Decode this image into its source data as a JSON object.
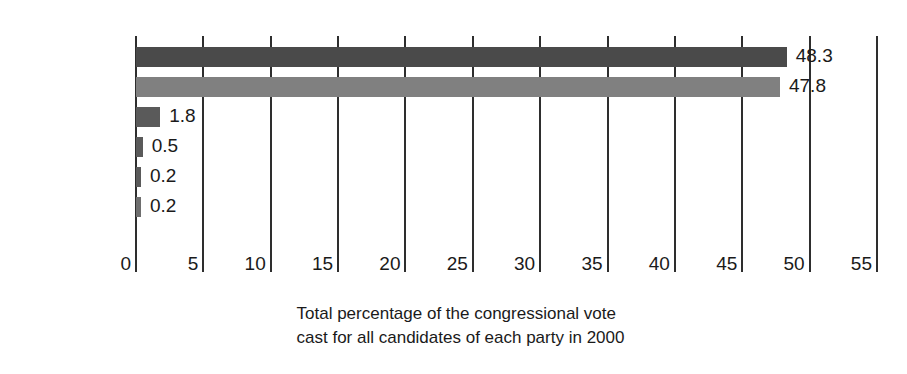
{
  "chart_data": {
    "type": "bar",
    "orientation": "horizontal",
    "title": "",
    "caption_line1": "Total percentage of the congressional vote",
    "caption_line2": "cast for all candidates of each party in 2000",
    "xlabel": "",
    "ylabel": "",
    "xlim": [
      0,
      55
    ],
    "xticks": [
      0,
      5,
      10,
      15,
      20,
      25,
      30,
      35,
      40,
      45,
      50,
      55
    ],
    "xtick_labels": [
      "0",
      "5",
      "10",
      "15",
      "20",
      "25",
      "30",
      "35",
      "40",
      "45",
      "50",
      "55"
    ],
    "grid": true,
    "legend": "none",
    "categories": [
      "Republicans",
      "Democrats",
      "Libertarians",
      "Natural Law",
      "Reform",
      "Green"
    ],
    "values": [
      48.3,
      47.8,
      1.8,
      0.5,
      0.2,
      0.2
    ],
    "value_labels": [
      "48.3",
      "47.8",
      "1.8",
      "0.5",
      "0.2",
      "0.2"
    ],
    "bar_colors": [
      "#4a4a4a",
      "#808080",
      "#5a5a5a",
      "#5a5a5a",
      "#5a5a5a",
      "#6e6e6e"
    ],
    "bars": [
      {
        "category": "Republicans",
        "value": 48.3,
        "label": "48.3",
        "color": "#4a4a4a"
      },
      {
        "category": "Democrats",
        "value": 47.8,
        "label": "47.8",
        "color": "#808080"
      },
      {
        "category": "Libertarians",
        "value": 1.8,
        "label": "1.8",
        "color": "#5a5a5a"
      },
      {
        "category": "Natural Law",
        "value": 0.5,
        "label": "0.5",
        "color": "#5a5a5a"
      },
      {
        "category": "Reform",
        "value": 0.2,
        "label": "0.2",
        "color": "#5a5a5a"
      },
      {
        "category": "Green",
        "value": 0.2,
        "label": "0.2",
        "color": "#6e6e6e"
      }
    ],
    "colors": {
      "background": "#ffffff",
      "gridline": "#2e2e2e",
      "text": "#1a1a1a"
    }
  }
}
